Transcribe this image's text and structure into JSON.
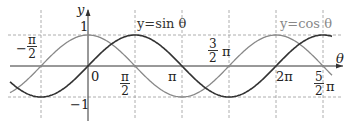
{
  "chart_data": {
    "type": "line",
    "title": "",
    "xlabel": "θ",
    "ylabel": "y",
    "xlim": [
      -2.4,
      8.3
    ],
    "ylim": [
      -1.3,
      1.5
    ],
    "grid": "dashed reference lines at multiples of π/2 and y=±1",
    "x_ticks": [
      "-π/2",
      "0",
      "π/2",
      "π",
      "3/2π",
      "2π",
      "5/2π"
    ],
    "y_ticks": [
      "1",
      "-1"
    ],
    "series": [
      {
        "name": "y=sin θ",
        "function": "sin",
        "color": "#333333"
      },
      {
        "name": "y=cos θ",
        "function": "cos",
        "color": "#888888"
      }
    ]
  },
  "labels": {
    "y_axis": "y",
    "x_axis": "θ",
    "origin": "0",
    "one": "1",
    "minus_one": "−1",
    "sin_label": "y=sin θ",
    "cos_label": "y=cos θ",
    "neg_half_pi": {
      "sign": "−",
      "num": "π",
      "den": "2"
    },
    "half_pi": {
      "num": "π",
      "den": "2"
    },
    "pi": "π",
    "three_half_pi": {
      "num": "3",
      "den": "2",
      "suffix": "π"
    },
    "two_pi": "2π",
    "five_half_pi": {
      "num": "5",
      "den": "2",
      "suffix": "π"
    }
  }
}
